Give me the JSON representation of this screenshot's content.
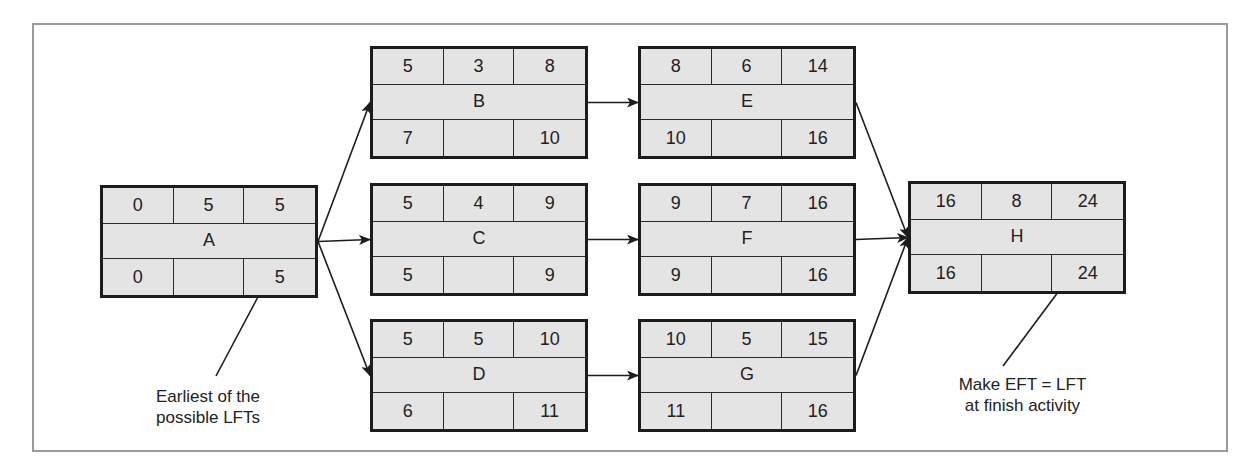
{
  "diagram": {
    "type": "activity-on-node network (critical path)",
    "nodes": [
      {
        "id": "A",
        "label": "A",
        "top": [
          "0",
          "5",
          "5"
        ],
        "bottom": [
          "0",
          "",
          "5"
        ]
      },
      {
        "id": "B",
        "label": "B",
        "top": [
          "5",
          "3",
          "8"
        ],
        "bottom": [
          "7",
          "",
          "10"
        ]
      },
      {
        "id": "C",
        "label": "C",
        "top": [
          "5",
          "4",
          "9"
        ],
        "bottom": [
          "5",
          "",
          "9"
        ]
      },
      {
        "id": "D",
        "label": "D",
        "top": [
          "5",
          "5",
          "10"
        ],
        "bottom": [
          "6",
          "",
          "11"
        ]
      },
      {
        "id": "E",
        "label": "E",
        "top": [
          "8",
          "6",
          "14"
        ],
        "bottom": [
          "10",
          "",
          "16"
        ]
      },
      {
        "id": "F",
        "label": "F",
        "top": [
          "9",
          "7",
          "16"
        ],
        "bottom": [
          "9",
          "",
          "16"
        ]
      },
      {
        "id": "G",
        "label": "G",
        "top": [
          "10",
          "5",
          "15"
        ],
        "bottom": [
          "11",
          "",
          "16"
        ]
      },
      {
        "id": "H",
        "label": "H",
        "top": [
          "16",
          "8",
          "24"
        ],
        "bottom": [
          "16",
          "",
          "24"
        ]
      }
    ],
    "edges": [
      [
        "A",
        "B"
      ],
      [
        "A",
        "C"
      ],
      [
        "A",
        "D"
      ],
      [
        "B",
        "E"
      ],
      [
        "C",
        "F"
      ],
      [
        "D",
        "G"
      ],
      [
        "E",
        "H"
      ],
      [
        "F",
        "H"
      ],
      [
        "G",
        "H"
      ]
    ],
    "annotations": {
      "left": [
        "Earliest of the",
        "possible LFTs"
      ],
      "right": [
        "Make EFT = LFT",
        "at finish activity"
      ]
    }
  }
}
